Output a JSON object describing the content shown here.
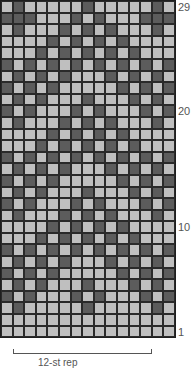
{
  "chart": {
    "columns": 15,
    "rows_count": 29,
    "colors": {
      "light": "#bfbfbf",
      "dark": "#5c5c5c",
      "grid": "#1e1e1e"
    },
    "row_labels": [
      {
        "text": "29",
        "row": 29
      },
      {
        "text": "20",
        "row": 20
      },
      {
        "text": "10",
        "row": 10
      },
      {
        "text": "1",
        "row": 1
      }
    ],
    "repeat_label": "12-st rep",
    "rows_top_to_bottom": [
      "LDLLLLLDLLLLLDL",
      "DDDLLLDLDLLLDDD",
      "LDLLLDLDLDLLLDL",
      "LLLLDLDLDLDLLLL",
      "LLLDLDLDLDLDLLL",
      "DLDLDLDLDLDLDLD",
      "LDLDLDLLLDLDLDL",
      "DLDLDLLLLLDLDLD",
      "LDLDLLLDLLLDLDL",
      "DLDLLLDLDLLLDLD",
      "LDLLLDLDLDLLLDL",
      "LLLLDLDLDLDLLLL",
      "LLLDLDLDLDLDLLL",
      "DLDLDLDLDLDLDLD",
      "LDLDLDLLLDLDLDL",
      "DLDLDLLLLLDLDLD",
      "LDLDLLLDLLLDLDL",
      "DLDLLLDLDLLLDLD",
      "LDLLLDLDLDLLLDL",
      "LLLLDLDLDLDLLLL",
      "LLLDLDLDLDLDLLL",
      "DLDLDLDLDLDLDLD",
      "LDLDLDLLLDLDLDL",
      "DLDLDLLLLLDLDLD",
      "LDLDLLLDLLLDLDL",
      "DLDLLLDLDLLLDLD",
      "LDLLLLLDLLLLLDL",
      "LLLLLLLLLLLLLLL",
      "LLLLLLLLLLLLLLL"
    ]
  }
}
